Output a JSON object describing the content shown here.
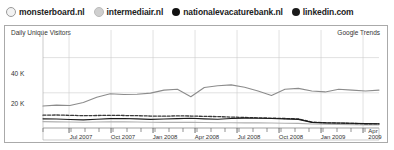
{
  "legend": {
    "items": [
      {
        "label": "monsterboard.nl",
        "marker": "circle-icon",
        "color": "#9a9a9a",
        "style": "solid"
      },
      {
        "label": "intermediair.nl",
        "marker": "circle-icon",
        "color": "#cccccc",
        "style": "dashed"
      },
      {
        "label": "nationalevacaturebank.nl",
        "marker": "circle-icon",
        "color": "#111111",
        "style": "solid"
      },
      {
        "label": "linkedin.com",
        "marker": "circle-icon",
        "color": "#222222",
        "style": "solid"
      }
    ]
  },
  "panel": {
    "title": "Daily Unique Visitors",
    "source": "Google Trends"
  },
  "axis": {
    "y_ticks": [
      "40 K",
      "20 K"
    ],
    "x_ticks": [
      "Jul 2007",
      "Oct 2007",
      "Jan 2008",
      "Apr 2008",
      "Jul 2008",
      "Oct 2008",
      "Jan 2009",
      "Apr 2009"
    ]
  },
  "chart_data": {
    "type": "line",
    "title": "Daily Unique Visitors",
    "subtitle": "Google Trends",
    "xlabel": "",
    "ylabel": "Daily Unique Visitors",
    "ylim": [
      0,
      50000
    ],
    "y_tick_values": [
      20000,
      40000
    ],
    "y_tick_labels": [
      "20 K",
      "40 K"
    ],
    "grid": true,
    "legend_position": "top",
    "x_tick_labels": [
      "Jul 2007",
      "Oct 2007",
      "Jan 2008",
      "Apr 2008",
      "Jul 2008",
      "Oct 2008",
      "Jan 2009",
      "Apr 2009"
    ],
    "x": [
      "2007-05",
      "2007-06",
      "2007-07",
      "2007-08",
      "2007-09",
      "2007-10",
      "2007-11",
      "2007-12",
      "2008-01",
      "2008-02",
      "2008-03",
      "2008-04",
      "2008-05",
      "2008-06",
      "2008-07",
      "2008-08",
      "2008-09",
      "2008-10",
      "2008-11",
      "2008-12",
      "2009-01",
      "2009-02",
      "2009-03",
      "2009-04",
      "2009-05",
      "2009-06"
    ],
    "series": [
      {
        "name": "monsterboard.nl",
        "color": "#8c8c8c",
        "style": "solid",
        "values": [
          12500,
          13000,
          12800,
          14500,
          17500,
          19500,
          19000,
          19200,
          19800,
          21500,
          22000,
          17800,
          23000,
          24000,
          24500,
          23200,
          21000,
          18500,
          22000,
          22500,
          21000,
          20500,
          22000,
          21500,
          21000,
          21500
        ]
      },
      {
        "name": "intermediair.nl",
        "color": "#3a3a3a",
        "style": "dashed",
        "values": [
          7300,
          7400,
          7200,
          7000,
          7100,
          7200,
          7100,
          7000,
          6800,
          6700,
          6900,
          6800,
          6600,
          6500,
          6200,
          6000,
          5800,
          5600,
          5400,
          5200,
          3400,
          3000,
          2800,
          2600,
          2400,
          2300
        ]
      },
      {
        "name": "nationalevacaturebank.nl",
        "color": "#1a1a1a",
        "style": "solid",
        "values": [
          5200,
          5100,
          4800,
          4600,
          5000,
          5300,
          5400,
          5200,
          4900,
          5100,
          5300,
          5500,
          5200,
          5000,
          5400,
          5600,
          5500,
          5400,
          5200,
          4900,
          3200,
          2900,
          2800,
          2700,
          2500,
          2400
        ]
      },
      {
        "name": "linkedin.com",
        "color": "#b0b0b0",
        "style": "solid",
        "values": [
          3600,
          3500,
          3400,
          3300,
          3400,
          3500,
          3500,
          3400,
          3300,
          3200,
          3300,
          3200,
          3100,
          3000,
          3000,
          2900,
          2900,
          2800,
          2700,
          2600,
          2300,
          2100,
          2000,
          1900,
          1800,
          1800
        ]
      }
    ]
  }
}
